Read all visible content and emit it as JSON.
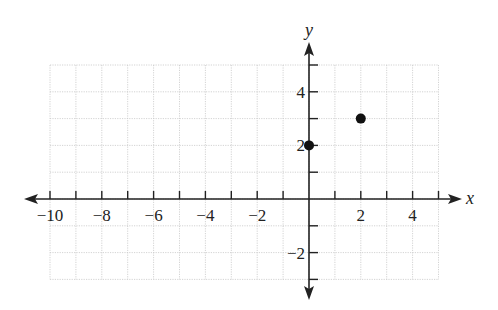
{
  "chart_data": {
    "type": "scatter",
    "title": "",
    "xlabel": "x",
    "ylabel": "y",
    "xlim": [
      -10,
      5
    ],
    "ylim": [
      -3,
      5
    ],
    "grid": true,
    "x_ticks": [
      -10,
      -9,
      -8,
      -7,
      -6,
      -5,
      -4,
      -3,
      -2,
      -1,
      1,
      2,
      3,
      4,
      5
    ],
    "x_tick_labels": [
      {
        "value": -10,
        "label": "−10"
      },
      {
        "value": -8,
        "label": "−8"
      },
      {
        "value": -6,
        "label": "−6"
      },
      {
        "value": -4,
        "label": "−4"
      },
      {
        "value": -2,
        "label": "−2"
      },
      {
        "value": 2,
        "label": "2"
      },
      {
        "value": 4,
        "label": "4"
      }
    ],
    "y_ticks": [
      -3,
      -2,
      -1,
      1,
      2,
      3,
      4,
      5
    ],
    "y_tick_labels": [
      {
        "value": -2,
        "label": "−2"
      },
      {
        "value": 2,
        "label": "2"
      },
      {
        "value": 4,
        "label": "4"
      }
    ],
    "points": [
      {
        "x": 0,
        "y": 2
      },
      {
        "x": 2,
        "y": 3
      }
    ],
    "colors": {
      "axis": "#222222",
      "grid": "#c8c8c8",
      "point": "#111111"
    }
  }
}
